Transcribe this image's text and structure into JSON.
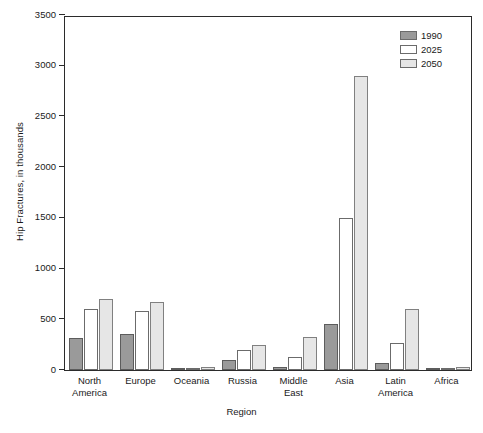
{
  "chart_data": {
    "type": "bar",
    "title": "",
    "xlabel": "Region",
    "ylabel": "Hip Fractures, in thousands",
    "ylim": [
      0,
      3500
    ],
    "yticks": [
      0,
      500,
      1000,
      1500,
      2000,
      2500,
      3000,
      3500
    ],
    "ytick_labels": [
      "0",
      "500",
      "1000",
      "1500",
      "2000",
      "2500",
      "3000",
      "3500"
    ],
    "grid": false,
    "legend_position": "top-right",
    "categories": [
      "North America",
      "Europe",
      "Oceania",
      "Russia",
      "Middle East",
      "Asia",
      "Latin America",
      "Africa"
    ],
    "category_lines": [
      [
        "North",
        "America"
      ],
      [
        "Europe",
        ""
      ],
      [
        "Oceania",
        ""
      ],
      [
        "Russia",
        ""
      ],
      [
        "Middle",
        "East"
      ],
      [
        "Asia",
        ""
      ],
      [
        "Latin",
        "America"
      ],
      [
        "Africa",
        ""
      ]
    ],
    "series": [
      {
        "name": "1990",
        "color": "#9a9a9a",
        "values": [
          320,
          360,
          5,
          100,
          25,
          450,
          65,
          10
        ]
      },
      {
        "name": "2025",
        "color": "#ffffff",
        "values": [
          600,
          585,
          15,
          200,
          125,
          1500,
          265,
          20
        ]
      },
      {
        "name": "2050",
        "color": "#e6e6e6",
        "values": [
          700,
          675,
          30,
          250,
          330,
          2900,
          600,
          25
        ]
      }
    ]
  }
}
